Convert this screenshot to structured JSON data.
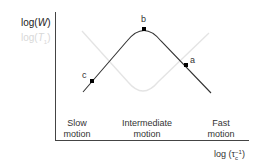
{
  "axes": {
    "y_label_primary": "log(W)",
    "y_label_primary_base": "log(",
    "y_label_primary_var": "W",
    "y_label_primary_close": ")",
    "y_label_secondary_base": "log(",
    "y_label_secondary_var": "T",
    "y_label_secondary_sub": "1",
    "y_label_secondary_close": ")",
    "x_label_base": "log (τ",
    "x_label_sup": "−1",
    "x_label_sub": "c",
    "x_label_close": ")"
  },
  "regions": [
    {
      "line1": "Slow",
      "line2": "motion"
    },
    {
      "line1": "Intermediate",
      "line2": "motion"
    },
    {
      "line1": "Fast",
      "line2": "motion"
    }
  ],
  "points": [
    {
      "label": "a",
      "x": 186,
      "y": 65
    },
    {
      "label": "b",
      "x": 144,
      "y": 29
    },
    {
      "label": "c",
      "x": 92,
      "y": 81
    }
  ],
  "colors": {
    "primary_curve": "#333333",
    "secondary_curve": "#e2e2e2",
    "axis": "#444444",
    "secondary_label": "#d0d0d0"
  }
}
